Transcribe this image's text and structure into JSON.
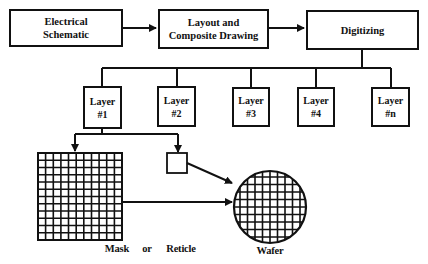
{
  "diagram": {
    "type": "flowchart",
    "top_row": [
      {
        "id": "electrical-schematic",
        "line1": "Electrical",
        "line2": "Schematic"
      },
      {
        "id": "layout-composite",
        "line1": "Layout and",
        "line2": "Composite Drawing"
      },
      {
        "id": "digitizing",
        "line1": "Digitizing",
        "line2": ""
      }
    ],
    "layers": [
      {
        "line1": "Layer",
        "line2": "#1"
      },
      {
        "line1": "Layer",
        "line2": "#2"
      },
      {
        "line1": "Layer",
        "line2": "#3"
      },
      {
        "line1": "Layer",
        "line2": "#4"
      },
      {
        "line1": "Layer",
        "line2": "#n"
      }
    ],
    "labels": {
      "mask": "Mask",
      "or": "or",
      "reticle": "Reticle",
      "wafer": "Wafer"
    },
    "colors": {
      "stroke": "#111111",
      "background": "#ffffff"
    }
  }
}
